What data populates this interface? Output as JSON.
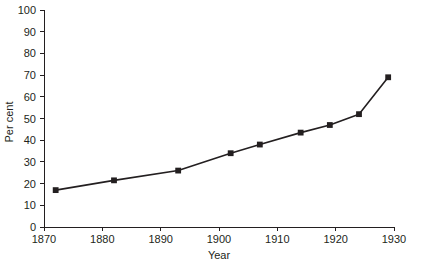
{
  "chart_data": {
    "type": "line",
    "title": "",
    "subtitle": "",
    "xlabel": "Year",
    "ylabel": "Per cent",
    "xlim": [
      1870,
      1930
    ],
    "ylim": [
      0,
      100
    ],
    "xticks": [
      1870,
      1880,
      1890,
      1900,
      1910,
      1920,
      1930
    ],
    "yticks": [
      0,
      10,
      20,
      30,
      40,
      50,
      60,
      70,
      80,
      90,
      100
    ],
    "xtick_labels": [
      "1870",
      "1880",
      "1890",
      "1900",
      "1910",
      "1920",
      "1930"
    ],
    "ytick_labels": [
      "0",
      "10",
      "20",
      "30",
      "40",
      "50",
      "60",
      "70",
      "80",
      "90",
      "100"
    ],
    "grid": false,
    "legend": null,
    "legend_position": "none",
    "marker": "square",
    "marker_color": "#231f20",
    "line_color": "#231f20",
    "x": [
      1872,
      1882,
      1893,
      1902,
      1907,
      1914,
      1919,
      1924,
      1929
    ],
    "values": [
      17,
      21.5,
      26,
      34,
      38,
      43.5,
      47,
      52,
      69
    ],
    "series": [
      {
        "name": "Per cent",
        "x": [
          1872,
          1882,
          1893,
          1902,
          1907,
          1914,
          1919,
          1924,
          1929
        ],
        "values": [
          17,
          21.5,
          26,
          34,
          38,
          43.5,
          47,
          52,
          69
        ]
      }
    ],
    "annotations": []
  },
  "axes": {
    "y_axis_title": "Per cent",
    "x_axis_title": "Year"
  },
  "colors": {
    "ink": "#231f20",
    "background": "#ffffff"
  }
}
